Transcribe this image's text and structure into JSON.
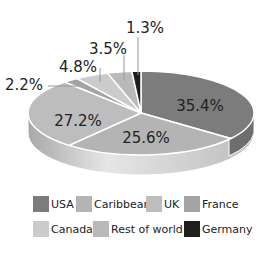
{
  "chart_data": {
    "type": "pie",
    "title": "",
    "style": "3d-tilted",
    "slices": [
      {
        "label": "USA",
        "value": 35.4,
        "display": "35.4%",
        "color": "#7c7c7c"
      },
      {
        "label": "Caribbean",
        "value": 25.6,
        "display": "25.6%",
        "color": "#b4b4b4"
      },
      {
        "label": "UK",
        "value": 27.2,
        "display": "27.2%",
        "color": "#bdbdbd"
      },
      {
        "label": "France",
        "value": 2.2,
        "display": "2.2%",
        "color": "#a3a3a3"
      },
      {
        "label": "Canada",
        "value": 4.8,
        "display": "4.8%",
        "color": "#cbcbcb"
      },
      {
        "label": "Rest of world",
        "value": 3.5,
        "display": "3.5%",
        "color": "#b9b9b9"
      },
      {
        "label": "Germany",
        "value": 1.3,
        "display": "1.3%",
        "color": "#1e1e1e"
      }
    ],
    "legend": {
      "position": "bottom",
      "entries": [
        "USA",
        "Caribbean",
        "UK",
        "France",
        "Canada",
        "Rest of world",
        "Germany"
      ]
    }
  },
  "legend": {
    "items": [
      {
        "label": "USA",
        "color": "#7c7c7c"
      },
      {
        "label": "Caribbean",
        "color": "#b4b4b4"
      },
      {
        "label": "UK",
        "color": "#bdbdbd"
      },
      {
        "label": "France",
        "color": "#a3a3a3"
      },
      {
        "label": "Canada",
        "color": "#cbcbcb"
      },
      {
        "label": "Rest of world",
        "color": "#b9b9b9"
      },
      {
        "label": "Germany",
        "color": "#1e1e1e"
      }
    ]
  },
  "labels": {
    "usa": "35.4%",
    "caribbean": "25.6%",
    "uk": "27.2%",
    "france": "2.2%",
    "canada": "4.8%",
    "rest": "3.5%",
    "germany": "1.3%"
  }
}
